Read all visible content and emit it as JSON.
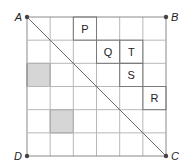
{
  "diagram": {
    "grid": {
      "rows": 6,
      "cols": 6,
      "x0": 27,
      "y0": 17,
      "cell": 23.17,
      "line_color": "#b8b8b8",
      "border_color": "#8a8a8a"
    },
    "corners": [
      {
        "label": "A",
        "pos": "top-left"
      },
      {
        "label": "B",
        "pos": "top-right"
      },
      {
        "label": "C",
        "pos": "bottom-right"
      },
      {
        "label": "D",
        "pos": "bottom-left"
      }
    ],
    "diagonal": {
      "from": "A",
      "to": "C",
      "color": "#6a6a6a"
    },
    "labeled_cells": [
      {
        "label": "P",
        "col": 2,
        "row": 0
      },
      {
        "label": "Q",
        "col": 3,
        "row": 1
      },
      {
        "label": "T",
        "col": 4,
        "row": 1
      },
      {
        "label": "S",
        "col": 4,
        "row": 2
      },
      {
        "label": "R",
        "col": 5,
        "row": 3
      }
    ],
    "shaded_cells": [
      {
        "col": 0,
        "row": 2,
        "color": "#d6d6d6"
      },
      {
        "col": 1,
        "row": 4,
        "color": "#d6d6d6"
      }
    ]
  }
}
